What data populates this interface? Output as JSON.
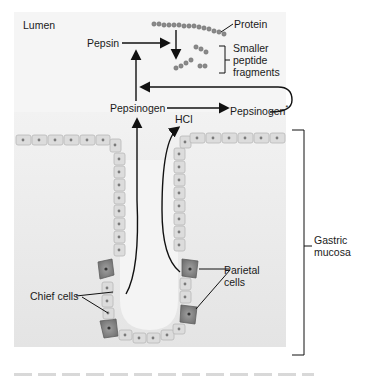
{
  "diagram": {
    "region_labels": {
      "lumen": "Lumen",
      "gastric_mucosa_line1": "Gastric",
      "gastric_mucosa_line2": "mucosa"
    },
    "molecules": {
      "protein": "Protein",
      "fragments_line1": "Smaller",
      "fragments_line2": "peptide",
      "fragments_line3": "fragments",
      "pepsin": "Pepsin",
      "pepsinogen": "Pepsinogen",
      "pepsinogen_star": "Pepsinogen",
      "star_mark": "*",
      "hcl": "HCl"
    },
    "cells": {
      "chief": "Chief cells",
      "parietal_line1": "Parietal",
      "parietal_line2": "cells"
    },
    "colors": {
      "background_panel": "#ececec",
      "cell_fill": "#dcdcdc",
      "cell_edge": "#b4b4b4",
      "parietal_fill": "#8c8c8c",
      "nucleus": "#7a7a7a",
      "arrow": "#111111",
      "bead": "#8a8a8a"
    }
  }
}
